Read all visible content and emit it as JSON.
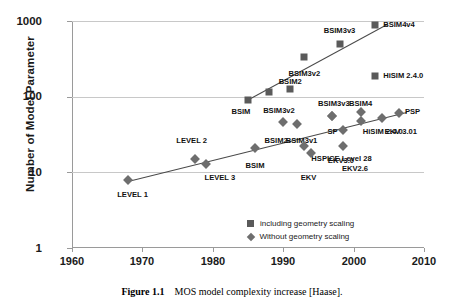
{
  "caption": {
    "figure_number": "Figure 1.1",
    "text": "MOS model complexity increase [Haase]."
  },
  "legend": {
    "position": "inside-bottom-right",
    "entries": [
      {
        "marker": "square",
        "label": "including geometry scaling"
      },
      {
        "marker": "diamond",
        "label": "Without geometry scaling"
      }
    ]
  },
  "chart_data": {
    "type": "scatter",
    "title": "",
    "xlabel": "",
    "ylabel": "Number of Model Parameter",
    "xlim": [
      1960,
      2010
    ],
    "ylim": [
      1,
      1000
    ],
    "yscale": "log",
    "grid": true,
    "xticks": [
      "1960",
      "1970",
      "1980",
      "1990",
      "2000",
      "2010"
    ],
    "yticks": [
      "1",
      "10",
      "100",
      "1000"
    ],
    "series": [
      {
        "name": "including geometry scaling",
        "marker": "square",
        "color": "#5a5a5a",
        "points": [
          {
            "label": "BSIM",
            "x": 1985,
            "y": 90,
            "lx": 1984.0,
            "ly": 62,
            "align": "c"
          },
          {
            "label": "BSIM3v2",
            "x": 1988,
            "y": 115,
            "lx": 1989.4,
            "ly": 64,
            "align": "c"
          },
          {
            "label": "BSIM2",
            "x": 1991,
            "y": 125,
            "lx": 1991.0,
            "ly": 155,
            "align": "c"
          },
          {
            "label": "BSIM3v2",
            "x": 1993,
            "y": 330,
            "lx": 1993.0,
            "ly": 200,
            "align": "c"
          },
          {
            "label": "BSIM3v3",
            "x": 1998,
            "y": 500,
            "lx": 1998.0,
            "ly": 730,
            "align": "c"
          },
          {
            "label": "BSIM4v4",
            "x": 2003,
            "y": 880,
            "lx": 2004.2,
            "ly": 880,
            "align": "l"
          },
          {
            "label": "HiSIM 2.4.0",
            "x": 2003,
            "y": 185,
            "lx": 2004.2,
            "ly": 185,
            "align": "l"
          }
        ]
      },
      {
        "name": "Without geometry scaling",
        "marker": "diamond",
        "color": "#6e6e6e",
        "points": [
          {
            "label": "LEVEL 1",
            "x": 1968,
            "y": 8,
            "lx": 1968.6,
            "ly": 5.0,
            "align": "c"
          },
          {
            "label": "LEVEL 2",
            "x": 1977.5,
            "y": 15,
            "lx": 1977.0,
            "ly": 26,
            "align": "c"
          },
          {
            "label": "LEVEL 3",
            "x": 1979,
            "y": 13,
            "lx": 1981.0,
            "ly": 8.3,
            "align": "c"
          },
          {
            "label": "BSIM",
            "x": 1986,
            "y": 21,
            "lx": 1986.0,
            "ly": 12.2,
            "align": "c"
          },
          {
            "label": "BSIM2",
            "x": 1990,
            "y": 46,
            "lx": 1989.0,
            "ly": 26,
            "align": "c"
          },
          {
            "label": "BSIM3v1",
            "x": 1992,
            "y": 43,
            "lx": 1992.6,
            "ly": 26,
            "align": "c"
          },
          {
            "label": "HSPICE Level 28",
            "x": 1993,
            "y": 22,
            "lx": 1994.0,
            "ly": 15.2,
            "align": "l"
          },
          {
            "label": "EKV",
            "x": 1994,
            "y": 18,
            "lx": 1993.6,
            "ly": 8.3,
            "align": "c"
          },
          {
            "label": "SP",
            "x": 1997,
            "y": 56,
            "lx": 1997.0,
            "ly": 34,
            "align": "c"
          },
          {
            "label": "BSIM3v3",
            "x": 1997,
            "y": 56,
            "lx": 1997.2,
            "ly": 80,
            "align": "c"
          },
          {
            "label": "EKV3.0",
            "x": 1998.5,
            "y": 36,
            "lx": 1998.2,
            "ly": 14.0,
            "align": "c"
          },
          {
            "label": "EKV2.6",
            "x": 1998.5,
            "y": 22,
            "lx": 2000.2,
            "ly": 11.0,
            "align": "c"
          },
          {
            "label": "HiSIM 2.4.0",
            "x": 2001,
            "y": 47,
            "lx": 2001.3,
            "ly": 34,
            "align": "l"
          },
          {
            "label": "BSIM4",
            "x": 2001,
            "y": 62,
            "lx": 2001.0,
            "ly": 80,
            "align": "c"
          },
          {
            "label": "EKV 3.01",
            "x": 2004,
            "y": 52,
            "lx": 2004.4,
            "ly": 34,
            "align": "l"
          },
          {
            "label": "PSP",
            "x": 2006.5,
            "y": 60,
            "lx": 2007.3,
            "ly": 62,
            "align": "l"
          }
        ]
      }
    ],
    "trendlines": [
      {
        "name": "steep-trend",
        "x0": 1984.6,
        "y0": 88,
        "x1": 2004.8,
        "y1": 920
      },
      {
        "name": "shallow-trend",
        "x0": 1968.0,
        "y0": 7.6,
        "x1": 2007.6,
        "y1": 62
      }
    ]
  }
}
